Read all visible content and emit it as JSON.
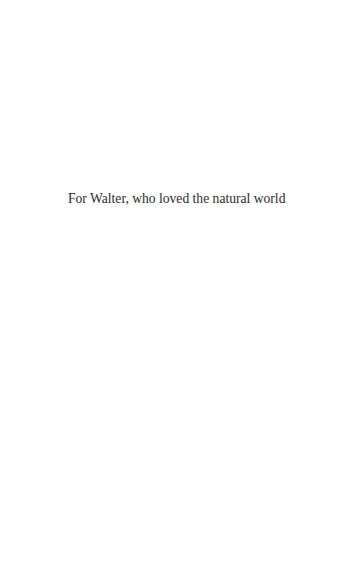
{
  "page": {
    "dedication": "For Walter, who loved the natural world"
  }
}
